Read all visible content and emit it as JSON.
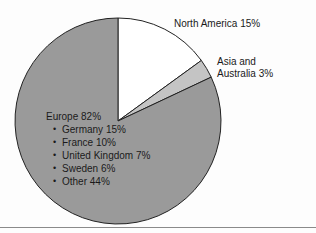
{
  "figure": {
    "background_color": "#fdfdfd",
    "rule_color": "#8a8a8a"
  },
  "labels": {
    "north_america": "North America 15%",
    "asia_line1": "Asia and",
    "asia_line2": "Australia 3%",
    "europe_title": "Europe 82%"
  },
  "chart_data": {
    "type": "pie",
    "title": "",
    "start_angle_deg": 0,
    "direction": "clockwise",
    "center": {
      "x": 118,
      "y": 121
    },
    "radius": 103,
    "stroke_color": "#222222",
    "legend": "none",
    "labels": [
      "North America",
      "Asia and Australia",
      "Europe"
    ],
    "values": [
      15,
      3,
      82
    ],
    "value_suffix": "%",
    "colors": [
      "#ffffff",
      "#c4c4c4",
      "#9a9a9a"
    ],
    "slices": [
      {
        "label": "North America",
        "value": 15,
        "display": "North America 15%",
        "color": "#ffffff",
        "start_deg": 0,
        "end_deg": 54
      },
      {
        "label": "Asia and Australia",
        "value": 3,
        "display": "Australia 3%",
        "color": "#c4c4c4",
        "start_deg": 54,
        "end_deg": 64.8
      },
      {
        "label": "Europe",
        "value": 82,
        "display": "Europe 82%",
        "color": "#9a9a9a",
        "start_deg": 64.8,
        "end_deg": 360,
        "breakdown": [
          {
            "label": "Germany",
            "value": 15,
            "display": "Germany 15%"
          },
          {
            "label": "France",
            "value": 10,
            "display": "France 10%"
          },
          {
            "label": "United Kingdom",
            "value": 7,
            "display": "United Kingdom 7%"
          },
          {
            "label": "Sweden",
            "value": 6,
            "display": "Sweden 6%"
          },
          {
            "label": "Other",
            "value": 44,
            "display": "Other 44%"
          }
        ]
      }
    ]
  }
}
